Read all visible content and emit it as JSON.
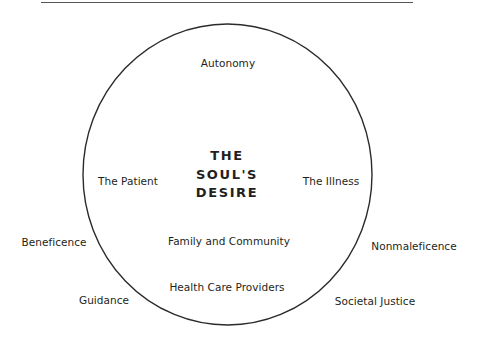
{
  "diagram": {
    "center_title": [
      "THE",
      "SOUL'S",
      "DESIRE"
    ],
    "inside_labels": {
      "top": "Autonomy",
      "left": "The Patient",
      "right": "The Illness",
      "lower_middle": "Family and Community",
      "bottom": "Health Care Providers"
    },
    "outside_labels": {
      "left_upper": "Beneficence",
      "left_lower": "Guidance",
      "right_upper": "Nonmaleficence",
      "right_lower": "Societal Justice"
    },
    "colors": {
      "stroke": "#2b2b2b",
      "text": "#231f20",
      "rule": "#555555"
    }
  }
}
